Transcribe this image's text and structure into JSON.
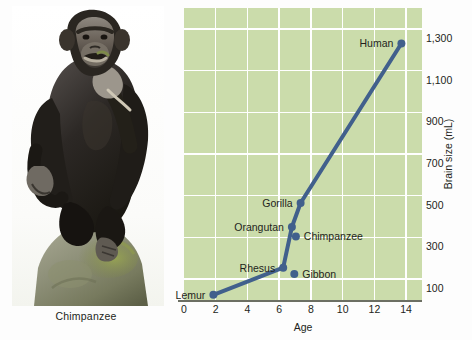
{
  "photo": {
    "caption": "Chimpanzee",
    "subject": "chimpanzee-seated-on-rock"
  },
  "chart_data": {
    "type": "line",
    "title": "",
    "xlabel": "Age",
    "ylabel": "Brain size (mL)",
    "xlim": [
      0,
      15
    ],
    "ylim": [
      0,
      1400
    ],
    "xticks": [
      0,
      2,
      4,
      6,
      8,
      10,
      12,
      14
    ],
    "xtick_labels": [
      "0",
      "2",
      "4",
      "6",
      "8",
      "10",
      "12",
      "14"
    ],
    "yticks": [
      100,
      300,
      500,
      700,
      900,
      1100,
      1300
    ],
    "ytick_labels": [
      "100",
      "300",
      "500",
      "700",
      "900",
      "1,100",
      "1,300"
    ],
    "grid": true,
    "legend": "none",
    "series": [
      {
        "name": "primate-brain-growth",
        "line_color": "#41608c",
        "points": [
          {
            "label": "Lemur",
            "x": 1.85,
            "y": 25,
            "label_side": "left"
          },
          {
            "label": "Rhesus",
            "x": 6.25,
            "y": 155,
            "label_side": "left"
          },
          {
            "label": "Gibbon",
            "x": 6.95,
            "y": 125,
            "label_side": "right"
          },
          {
            "label": "Orangutan",
            "x": 6.8,
            "y": 350,
            "label_side": "left"
          },
          {
            "label": "Chimpanzee",
            "x": 7.05,
            "y": 305,
            "label_side": "right"
          },
          {
            "label": "Gorilla",
            "x": 7.35,
            "y": 465,
            "label_side": "left"
          },
          {
            "label": "Human",
            "x": 13.7,
            "y": 1230,
            "label_side": "left"
          }
        ],
        "path_order": [
          "Lemur",
          "Rhesus",
          "Orangutan",
          "Gorilla",
          "Human"
        ]
      }
    ]
  },
  "colors": {
    "plot_background": "#cbdcab",
    "gridline": "#ffffff",
    "series_line": "#41608c",
    "axis_line": "#6c6f63",
    "text": "#231f20",
    "page_background": "#fdfdfd"
  }
}
